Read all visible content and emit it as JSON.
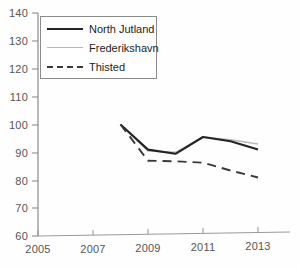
{
  "chart_data": {
    "type": "line",
    "title": "",
    "xlabel": "",
    "ylabel": "",
    "xlim": [
      2005,
      2014
    ],
    "ylim": [
      60,
      140
    ],
    "x_ticks": [
      2005,
      2007,
      2009,
      2011,
      2013
    ],
    "y_ticks": [
      60,
      70,
      80,
      90,
      100,
      110,
      120,
      130,
      140
    ],
    "grid": false,
    "legend_position": "top-left",
    "x": [
      2008,
      2009,
      2010,
      2011,
      2012,
      2013
    ],
    "series": [
      {
        "name": "North Jutland",
        "style": "solid",
        "color": "#242424",
        "values": [
          100,
          91,
          89.5,
          95.5,
          94,
          91
        ]
      },
      {
        "name": "Frederikshavn",
        "style": "solid",
        "color": "#b9b9b9",
        "values": [
          100,
          90.5,
          90,
          95.5,
          94.5,
          93
        ]
      },
      {
        "name": "Thisted",
        "style": "dashed",
        "color": "#3a3a3a",
        "values": [
          100,
          87,
          86.8,
          86.3,
          83.5,
          81
        ]
      }
    ]
  },
  "axes": {
    "y_tick_labels": [
      "140",
      "130",
      "120",
      "110",
      "100",
      "90",
      "80",
      "70",
      "60"
    ],
    "x_tick_labels": [
      "2005",
      "2007",
      "2009",
      "2011",
      "2013"
    ]
  },
  "legend": {
    "items": [
      {
        "label": "North Jutland",
        "swatch": "solid-dark"
      },
      {
        "label": "Frederikshavn",
        "swatch": "solid-light"
      },
      {
        "label": "Thisted",
        "swatch": "dashed"
      }
    ]
  },
  "colors": {
    "north_jutland": "#242424",
    "frederikshavn": "#b9b9b9",
    "thisted": "#3a3a3a",
    "axis": "#8a8a8a",
    "tick_text": "#555555"
  }
}
